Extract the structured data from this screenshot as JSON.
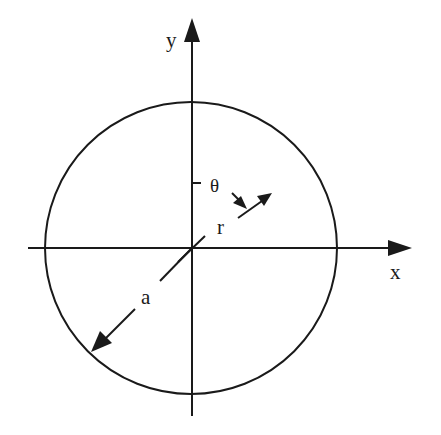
{
  "diagram": {
    "type": "polar-coordinate-circle",
    "colors": {
      "stroke": "#1a1a1a",
      "background": "#ffffff"
    },
    "labels": {
      "y_axis": "y",
      "x_axis": "x",
      "theta": "θ",
      "radius_r": "r",
      "radius_a": "a"
    },
    "geometry": {
      "origin": [
        192,
        248
      ],
      "circle_radius": 146,
      "x_axis_range": [
        28,
        410
      ],
      "y_axis_range": [
        18,
        416
      ]
    }
  }
}
